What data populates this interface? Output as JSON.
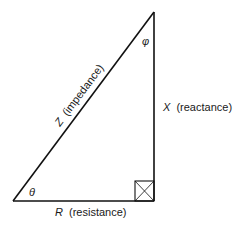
{
  "diagram": {
    "type": "impedance-triangle",
    "vertices": {
      "bottom_left": [
        13,
        201
      ],
      "bottom_right": [
        154,
        201
      ],
      "top_right": [
        154,
        12
      ]
    },
    "sides": {
      "hypotenuse": {
        "symbol": "Z",
        "label": "(impedance)"
      },
      "vertical": {
        "symbol": "X",
        "label": "(reactance)"
      },
      "base": {
        "symbol": "R",
        "label": "(resistance)"
      }
    },
    "angles": {
      "bottom_left": "θ",
      "top_right": "φ"
    },
    "right_angle_marker": "boxed-x",
    "colors": {
      "line": "#111111",
      "text": "#1a1a1a",
      "background": "#ffffff"
    }
  }
}
